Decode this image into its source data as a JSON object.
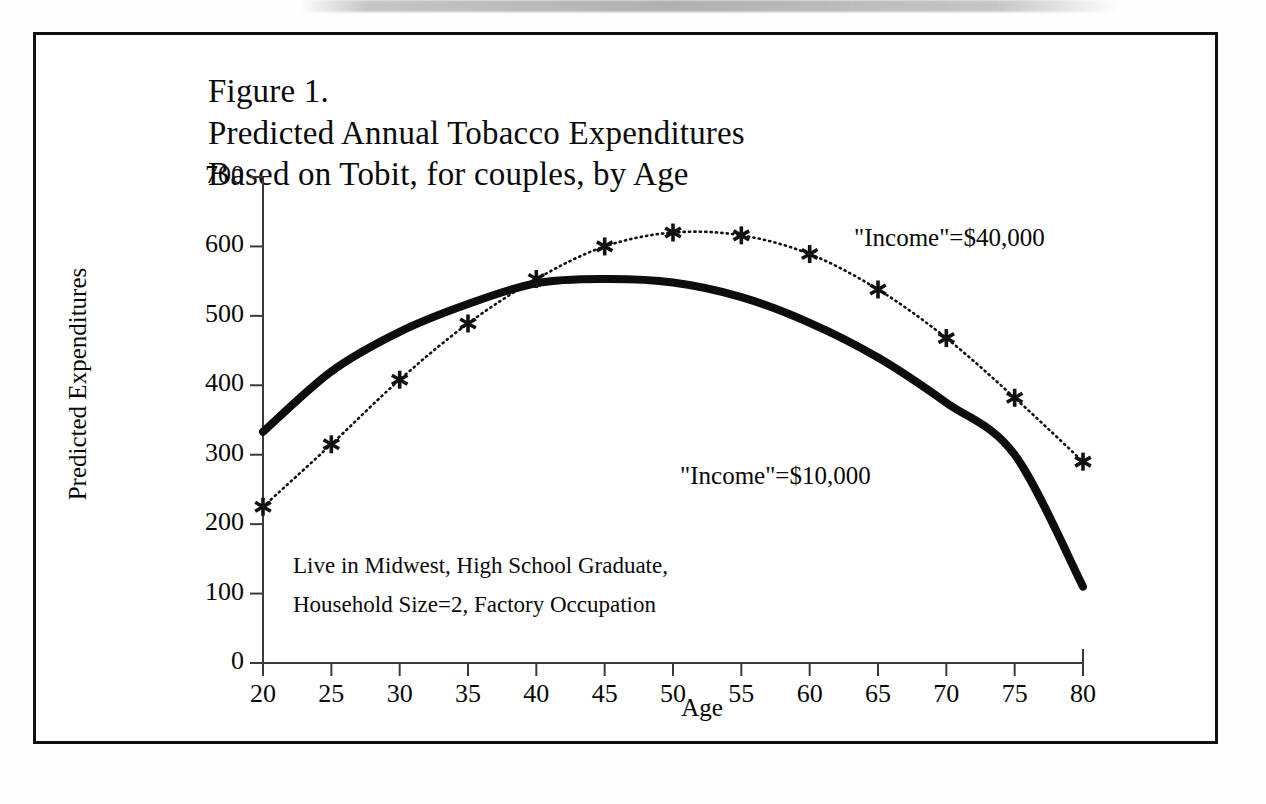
{
  "figure": {
    "title_lines": [
      "Figure 1.",
      "Predicted Annual Tobacco Expenditures",
      "Based on Tobit, for couples, by Age"
    ],
    "series_labels": {
      "high_income": "\"Income\"=$40,000",
      "low_income": "\"Income\"=$10,000"
    },
    "notes": [
      "Live in Midwest, High School Graduate,",
      "Household Size=2, Factory Occupation"
    ]
  },
  "chart_data": {
    "type": "line",
    "title": "Figure 1. Predicted Annual Tobacco Expenditures Based on Tobit, for couples, by Age",
    "xlabel": "Age",
    "ylabel": "Predicted Expenditures",
    "xlim": [
      20,
      80
    ],
    "ylim": [
      0,
      700
    ],
    "xticks": [
      20,
      25,
      30,
      35,
      40,
      45,
      50,
      55,
      60,
      65,
      70,
      75,
      80
    ],
    "xtick_labels": [
      "20",
      "25",
      "30",
      "35",
      "40",
      "45",
      "50",
      "55",
      "60",
      "65",
      "70",
      "75",
      "80"
    ],
    "yticks": [
      0,
      100,
      200,
      300,
      400,
      500,
      600,
      700
    ],
    "ytick_labels": [
      "0",
      "100",
      "200",
      "300",
      "400",
      "500",
      "600",
      "700"
    ],
    "grid": false,
    "legend": "inline-annotations",
    "x": [
      20,
      25,
      30,
      35,
      40,
      45,
      50,
      55,
      60,
      65,
      70,
      75,
      80
    ],
    "series": [
      {
        "name": "\"Income\"=$40,000",
        "style": "dotted",
        "marker": "asterisk",
        "color": "#111111",
        "values": [
          225,
          315,
          408,
          489,
          553,
          600,
          620,
          616,
          589,
          538,
          468,
          382,
          290
        ]
      },
      {
        "name": "\"Income\"=$10,000",
        "style": "solid-thick",
        "marker": "none",
        "color": "#0d0d0d",
        "values": [
          333,
          420,
          477,
          517,
          547,
          553,
          548,
          527,
          490,
          440,
          375,
          300,
          110
        ]
      }
    ],
    "annotations": [
      "Live in Midwest, High School Graduate,",
      "Household Size=2, Factory Occupation"
    ]
  },
  "axes_geometry": {
    "x_left_px": 263,
    "x_right_px": 1083,
    "y_zero_px": 663,
    "y_top_px": 177
  }
}
